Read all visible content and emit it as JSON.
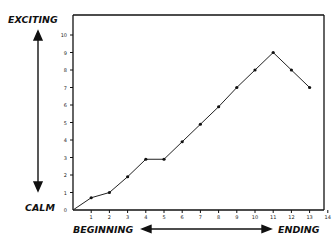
{
  "chart_data": {
    "type": "line",
    "title": "",
    "xlabel_left": "BEGINNING",
    "xlabel_right": "ENDING",
    "ylabel_top": "EXCITING",
    "ylabel_bottom": "CALM",
    "x": [
      0,
      1,
      2,
      3,
      4,
      5,
      6,
      7,
      8,
      9,
      10,
      11,
      12,
      13
    ],
    "values": [
      0,
      0.7,
      1.0,
      1.9,
      2.9,
      2.9,
      3.9,
      4.9,
      5.9,
      7.0,
      8.0,
      9.0,
      8.0,
      7.0
    ],
    "xticks": [
      "1",
      "2",
      "3",
      "4",
      "5",
      "6",
      "7",
      "8",
      "9",
      "10",
      "11",
      "12",
      "13",
      "14"
    ],
    "yticks": [
      "0",
      "1",
      "2",
      "3",
      "4",
      "5",
      "6",
      "7",
      "8",
      "9",
      "10"
    ],
    "xlim": [
      0,
      14
    ],
    "ylim": [
      0,
      11
    ],
    "grid": false,
    "legend": null,
    "line_color": "#222222"
  },
  "labels": {
    "exciting": "EXCITING",
    "calm": "CALM",
    "beginning": "BEGINNING",
    "ending": "ENDING"
  }
}
